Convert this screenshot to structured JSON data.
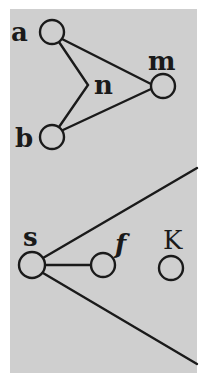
{
  "diagram": {
    "background_color": "#cfcfcf",
    "ink_color": "#1a1a1a",
    "top_graph": {
      "nodes": [
        {
          "id": "a",
          "label": "a",
          "cx": 52,
          "cy": 32
        },
        {
          "id": "b",
          "label": "b",
          "cx": 52,
          "cy": 137
        },
        {
          "id": "m",
          "label": "m",
          "cx": 163,
          "cy": 86
        }
      ],
      "junction": {
        "id": "n",
        "label": "n",
        "x": 88,
        "y": 85
      },
      "edges": [
        {
          "from": "a",
          "to": "m"
        },
        {
          "from": "b",
          "to": "m"
        },
        {
          "from": "a",
          "to": "n"
        },
        {
          "from": "n",
          "to": "b"
        }
      ]
    },
    "bottom_graph": {
      "nodes": [
        {
          "id": "s",
          "label": "s",
          "cx": 32,
          "cy": 265
        },
        {
          "id": "f",
          "label": "f",
          "cx": 103,
          "cy": 265
        },
        {
          "id": "K",
          "label": "K",
          "cx": 171,
          "cy": 268
        }
      ],
      "edges": [
        {
          "from": "s",
          "to": "f"
        }
      ],
      "rays": [
        {
          "from": "s",
          "direction": "upper-right"
        },
        {
          "from": "s",
          "direction": "lower-right"
        }
      ]
    }
  }
}
